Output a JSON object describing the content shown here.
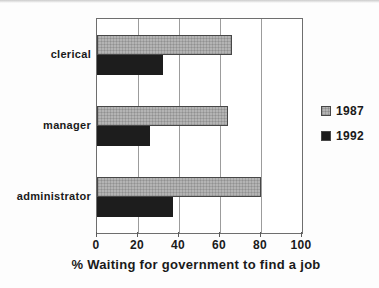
{
  "chart_data": {
    "type": "bar",
    "orientation": "horizontal",
    "title": "",
    "xlabel": "% Waiting for government to find a job",
    "categories": [
      "clerical",
      "manager",
      "administrator"
    ],
    "series": [
      {
        "name": "1987",
        "color": "#b4b4b4",
        "style": "hatched-gray",
        "values": [
          66,
          64,
          80
        ]
      },
      {
        "name": "1992",
        "color": "#1d1d1d",
        "style": "solid-black",
        "values": [
          32,
          26,
          37
        ]
      }
    ],
    "xlim": [
      0,
      100
    ],
    "xticks": [
      0,
      20,
      40,
      60,
      80,
      100
    ],
    "grid": true,
    "legend_position": "right-middle"
  },
  "colors": {
    "grid": "#9c9c9c",
    "frame": "#6e6e6e",
    "text": "#1a1a1a",
    "bar_1987": "#b4b4b4",
    "bar_1992": "#1d1d1d",
    "background": "#fdfdfd"
  }
}
